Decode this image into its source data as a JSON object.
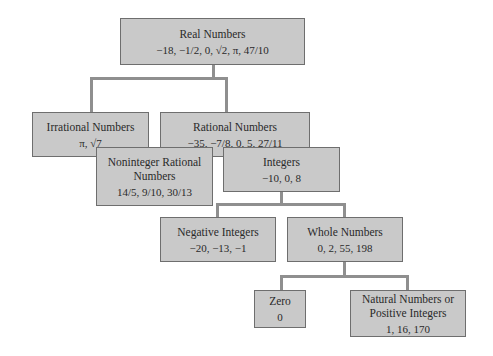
{
  "diagram": {
    "type": "hierarchy-tree",
    "nodes": {
      "real": {
        "title": "Real Numbers",
        "values": "−18, −1/2, 0, √2, π, 47/10"
      },
      "irrational": {
        "title": "Irrational Numbers",
        "values": "π, √7"
      },
      "rational": {
        "title": "Rational Numbers",
        "values": "−35, −7/8, 0, 5, 27/11"
      },
      "noninteger": {
        "title_line1": "Noninteger Rational",
        "title_line2": "Numbers",
        "values": "14/5, 9/10, 30/13"
      },
      "integers": {
        "title": "Integers",
        "values": "−10, 0, 8"
      },
      "negative": {
        "title": "Negative Integers",
        "values": "−20, −13, −1"
      },
      "whole": {
        "title": "Whole Numbers",
        "values": "0, 2, 55, 198"
      },
      "zero": {
        "title": "Zero",
        "values": "0"
      },
      "natural": {
        "title_line1": "Natural Numbers or",
        "title_line2": "Positive Integers",
        "values": "1, 16, 170"
      }
    },
    "edges": [
      [
        "real",
        "irrational"
      ],
      [
        "real",
        "rational"
      ],
      [
        "rational",
        "noninteger"
      ],
      [
        "rational",
        "integers"
      ],
      [
        "integers",
        "negative"
      ],
      [
        "integers",
        "whole"
      ],
      [
        "whole",
        "zero"
      ],
      [
        "whole",
        "natural"
      ]
    ],
    "colors": {
      "box_fill": "#c9c9c9",
      "box_border": "#6e6e6e",
      "connector": "#8f8f8f"
    }
  }
}
